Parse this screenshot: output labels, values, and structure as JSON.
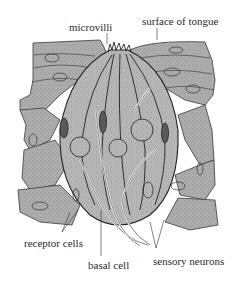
{
  "figure": {
    "labels": {
      "microvilli": "microvilli",
      "surface": "surface of tongue",
      "receptor": "receptor cells",
      "basal": "basal cell",
      "sensory": "sensory neurons"
    },
    "colors": {
      "tissue_fill": "#a9a9a9",
      "tissue_stipple": "#6e6e6e",
      "outline": "#2b2b2b",
      "nucleus_dark": "#5a5a5a",
      "text": "#2a2a2a",
      "background": "#ffffff"
    }
  }
}
